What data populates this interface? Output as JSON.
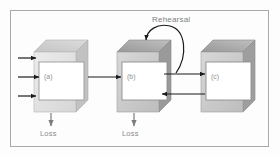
{
  "figure": {
    "background_color": "#fdfdfd",
    "frame_color": "#a9a9a9",
    "label_color": "#8a8a8a",
    "arrow_color": "#1a1a1a"
  },
  "boxes": [
    {
      "id": "a",
      "label": "(a)",
      "face_color": "#e2e2e2",
      "top_color": "#c9c9c9",
      "side_color": "#bdbdbd",
      "inner_color": "#ffffff"
    },
    {
      "id": "b",
      "label": "(b)",
      "face_color": "#cfcfcf",
      "top_color": "#9f9f9f",
      "side_color": "#8f8f8f",
      "inner_color": "#ffffff"
    },
    {
      "id": "c",
      "label": "(c)",
      "face_color": "#cfcfcf",
      "top_color": "#a3a3a3",
      "side_color": "#939393",
      "inner_color": "#ffffff"
    }
  ],
  "annotations": {
    "rehearsal": "Rehearsal",
    "loss_a": "Loss",
    "loss_b": "Loss"
  },
  "arrows": [
    {
      "name": "input-arrow-1",
      "from": "left-edge",
      "to": "box-a",
      "y": 58
    },
    {
      "name": "input-arrow-2",
      "from": "left-edge",
      "to": "box-a",
      "y": 77
    },
    {
      "name": "input-arrow-3",
      "from": "left-edge",
      "to": "box-a",
      "y": 95
    },
    {
      "name": "a-to-b-arrow",
      "from": "box-a",
      "to": "box-b",
      "y": 77
    },
    {
      "name": "b-to-c-arrow",
      "from": "box-b",
      "to": "box-c",
      "y": 74
    },
    {
      "name": "c-to-b-arrow",
      "from": "box-c",
      "to": "box-b",
      "y": 94
    },
    {
      "name": "rehearsal-loop-arrow",
      "from": "box-b",
      "to": "box-b",
      "type": "curved-loop"
    },
    {
      "name": "loss-arrow-a",
      "from": "box-a",
      "to": "loss-a",
      "type": "down"
    },
    {
      "name": "loss-arrow-b",
      "from": "box-b",
      "to": "loss-b",
      "type": "down"
    }
  ]
}
